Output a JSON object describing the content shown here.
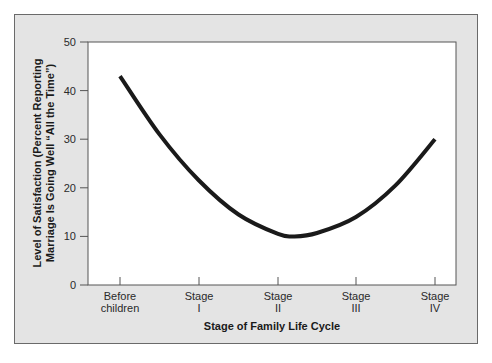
{
  "chart_data": {
    "type": "line",
    "title": "",
    "xlabel": "Stage of Family Life Cycle",
    "ylabel_lines": [
      "Level of Satisfaction (Percent Reporting",
      "Marriage Is Going Well “All the Time”)"
    ],
    "ylabel": "Level of Satisfaction (Percent Reporting Marriage Is Going Well “All the Time”)",
    "ylim": [
      0,
      50
    ],
    "yticks": [
      0,
      10,
      20,
      30,
      40,
      50
    ],
    "categories": [
      {
        "line1": "Before",
        "line2": "children"
      },
      {
        "line1": "Stage",
        "line2": "I"
      },
      {
        "line1": "Stage",
        "line2": "II"
      },
      {
        "line1": "Stage",
        "line2": "III"
      },
      {
        "line1": "Stage",
        "line2": "IV"
      }
    ],
    "category_labels": [
      "Before children",
      "Stage I",
      "Stage II",
      "Stage III",
      "Stage IV"
    ],
    "series": [
      {
        "name": "Marital satisfaction",
        "x": [
          0,
          0.5,
          1,
          1.5,
          2,
          2.2,
          2.5,
          3,
          3.5,
          4
        ],
        "values": [
          43,
          31,
          21.5,
          14.5,
          10.5,
          10,
          10.7,
          14,
          20.5,
          30
        ]
      }
    ],
    "grid": false,
    "legend": "none",
    "line_color": "#1a1a1a"
  }
}
